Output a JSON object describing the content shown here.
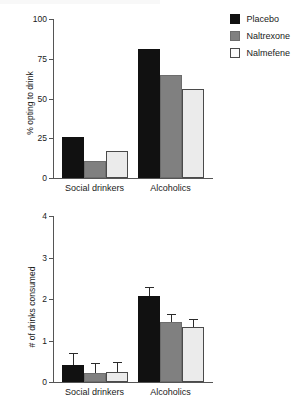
{
  "figure": {
    "legend": {
      "position": "top-right",
      "entries": [
        {
          "label": "Placebo",
          "color": "#111111"
        },
        {
          "label": "Naltrexone",
          "color": "#808080"
        },
        {
          "label": "Nalmefene",
          "color": "#ebebeb"
        }
      ]
    }
  },
  "chart_data": [
    {
      "type": "bar",
      "panel": "top",
      "title": "",
      "xlabel": "",
      "ylabel": "% opting to drink",
      "ylim": [
        0,
        100
      ],
      "yticks": [
        0,
        25,
        50,
        75,
        100
      ],
      "ytick_labels": [
        "0",
        "25",
        "50",
        "75",
        "100"
      ],
      "grid": false,
      "legend": "top-right",
      "categories": [
        "Social drinkers",
        "Alcoholics"
      ],
      "series": [
        {
          "name": "Placebo",
          "color": "#111111",
          "values": [
            26,
            81
          ]
        },
        {
          "name": "Naltrexone",
          "color": "#808080",
          "values": [
            11,
            65
          ]
        },
        {
          "name": "Nalmefene",
          "color": "#ebebeb",
          "values": [
            17,
            56
          ]
        }
      ]
    },
    {
      "type": "bar",
      "panel": "bottom",
      "title": "",
      "xlabel": "",
      "ylabel": "# of drinks consumed",
      "ylim": [
        0,
        4
      ],
      "yticks": [
        0,
        1,
        2,
        3,
        4
      ],
      "ytick_labels": [
        "0",
        "1",
        "2",
        "3",
        "4"
      ],
      "grid": false,
      "legend": "none",
      "categories": [
        "Social drinkers",
        "Alcoholics"
      ],
      "series": [
        {
          "name": "Placebo",
          "color": "#111111",
          "values": [
            0.42,
            2.07
          ],
          "errors": [
            0.29,
            0.22
          ]
        },
        {
          "name": "Naltrexone",
          "color": "#808080",
          "values": [
            0.21,
            1.45
          ],
          "errors": [
            0.24,
            0.18
          ]
        },
        {
          "name": "Nalmefene",
          "color": "#ebebeb",
          "values": [
            0.23,
            1.33
          ],
          "errors": [
            0.25,
            0.18
          ]
        }
      ]
    }
  ]
}
